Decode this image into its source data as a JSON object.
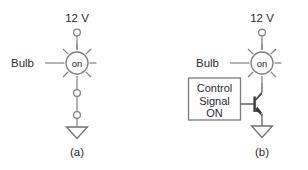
{
  "figure": {
    "background": "#ffffff",
    "line_color": "#808080",
    "text_color": "#2b2b2b"
  },
  "panel_a": {
    "caption": "(a)",
    "supply_label": "12 V",
    "bulb_label": "Bulb",
    "bulb_state": "on",
    "symbols": {
      "supply_terminal": "open-circle-terminal",
      "lamp": "lamp-glowing-icon",
      "node_upper": "open-circle-terminal",
      "node_lower": "open-circle-terminal",
      "ground": "ground-triangle-icon"
    }
  },
  "panel_b": {
    "caption": "(b)",
    "supply_label": "12 V",
    "bulb_label": "Bulb",
    "bulb_state": "on",
    "control_box": {
      "line1": "Control",
      "line2": "Signal",
      "line3": "ON"
    },
    "symbols": {
      "supply_terminal": "open-circle-terminal",
      "lamp": "lamp-glowing-icon",
      "transistor": "npn-transistor-icon",
      "ground": "ground-triangle-icon"
    }
  }
}
